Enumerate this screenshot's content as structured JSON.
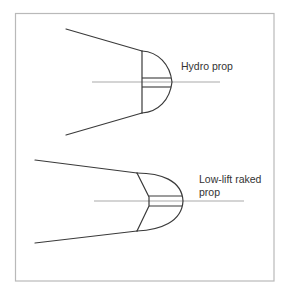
{
  "figure": {
    "colors": {
      "outline": "#3a3a3a",
      "centerline": "#a9a9a9",
      "frame": "#b9b9b9",
      "label": "#333333"
    },
    "props": [
      {
        "id": "hydro",
        "label_lines": [
          "Hydro prop"
        ]
      },
      {
        "id": "low-lift-raked",
        "label_lines": [
          "Low-lift raked",
          "prop"
        ]
      }
    ]
  }
}
